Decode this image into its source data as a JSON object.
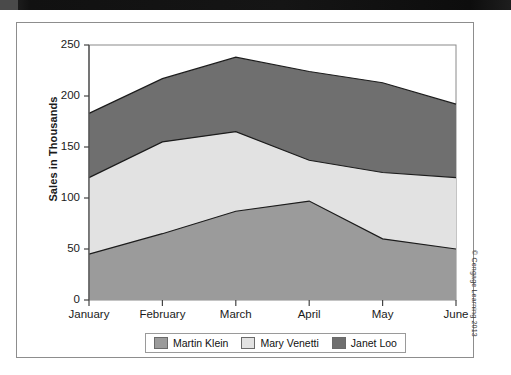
{
  "figure": {
    "copyright": "© Cengage Learning 2013"
  },
  "chart_data": {
    "type": "area",
    "stacked": true,
    "title": "",
    "xlabel": "",
    "ylabel": "Sales in Thousands",
    "categories": [
      "January",
      "February",
      "March",
      "April",
      "May",
      "June"
    ],
    "ylim": [
      0,
      250
    ],
    "yticks": [
      0,
      50,
      100,
      150,
      200,
      250
    ],
    "grid": false,
    "legend_position": "bottom",
    "series": [
      {
        "name": "Martin Klein",
        "color": "#9b9b9b",
        "values": [
          45,
          65,
          87,
          97,
          60,
          50
        ],
        "cumulative": [
          45,
          65,
          87,
          97,
          60,
          50
        ]
      },
      {
        "name": "Mary Venetti",
        "color": "#e2e2e2",
        "values": [
          75,
          90,
          78,
          40,
          65,
          70
        ],
        "cumulative": [
          120,
          155,
          165,
          137,
          125,
          120
        ]
      },
      {
        "name": "Janet Loo",
        "color": "#6f6f6f",
        "values": [
          63,
          62,
          73,
          87,
          88,
          72
        ],
        "cumulative": [
          183,
          217,
          238,
          224,
          213,
          192
        ]
      }
    ]
  }
}
